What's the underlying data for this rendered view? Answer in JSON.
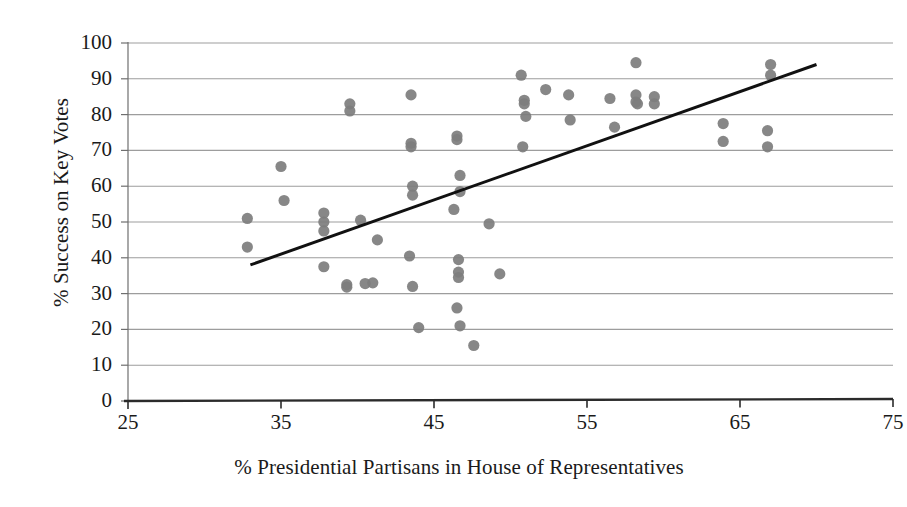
{
  "chart_data": {
    "type": "scatter",
    "title": "",
    "xlabel": "% Presidential Partisans in House of Representatives",
    "ylabel": "% Success on Key Votes",
    "xlim": [
      25,
      75
    ],
    "ylim": [
      0,
      100
    ],
    "xticks": [
      25,
      35,
      45,
      55,
      65,
      75
    ],
    "yticks": [
      0,
      10,
      20,
      30,
      40,
      50,
      60,
      70,
      80,
      90,
      100
    ],
    "grid": "horizontal",
    "legend": "none",
    "marker": {
      "shape": "circle",
      "color": "#7d7d7d",
      "size": 11
    },
    "trendline": {
      "type": "linear",
      "color": "#111111",
      "width": 3,
      "x_start": 33.0,
      "y_start": 38.0,
      "x_end": 70.0,
      "y_end": 94.0
    },
    "points": [
      [
        32.8,
        51.0
      ],
      [
        32.8,
        43.0
      ],
      [
        35.0,
        65.5
      ],
      [
        35.2,
        56.0
      ],
      [
        37.8,
        52.5
      ],
      [
        37.8,
        50.0
      ],
      [
        37.8,
        47.5
      ],
      [
        37.8,
        37.5
      ],
      [
        39.5,
        83.0
      ],
      [
        39.5,
        81.0
      ],
      [
        39.3,
        32.5
      ],
      [
        39.3,
        31.8
      ],
      [
        40.5,
        32.8
      ],
      [
        41.0,
        33.0
      ],
      [
        40.2,
        50.5
      ],
      [
        41.3,
        45.0
      ],
      [
        43.5,
        85.5
      ],
      [
        43.5,
        72.0
      ],
      [
        43.5,
        71.0
      ],
      [
        43.6,
        60.0
      ],
      [
        43.6,
        57.5
      ],
      [
        43.4,
        40.5
      ],
      [
        43.6,
        32.0
      ],
      [
        44.0,
        20.5
      ],
      [
        46.5,
        74.0
      ],
      [
        46.5,
        73.0
      ],
      [
        46.7,
        63.0
      ],
      [
        46.7,
        58.5
      ],
      [
        46.3,
        53.5
      ],
      [
        46.6,
        39.5
      ],
      [
        46.6,
        36.0
      ],
      [
        46.6,
        34.5
      ],
      [
        46.5,
        26.0
      ],
      [
        46.7,
        21.0
      ],
      [
        47.6,
        15.5
      ],
      [
        48.6,
        49.5
      ],
      [
        49.3,
        35.5
      ],
      [
        50.7,
        91.0
      ],
      [
        50.9,
        84.0
      ],
      [
        50.9,
        83.0
      ],
      [
        51.0,
        79.5
      ],
      [
        50.8,
        71.0
      ],
      [
        52.3,
        87.0
      ],
      [
        53.8,
        85.5
      ],
      [
        53.9,
        78.5
      ],
      [
        56.5,
        84.5
      ],
      [
        56.8,
        76.5
      ],
      [
        58.2,
        94.5
      ],
      [
        58.2,
        85.5
      ],
      [
        58.2,
        83.5
      ],
      [
        58.3,
        83.0
      ],
      [
        59.4,
        85.0
      ],
      [
        59.4,
        83.0
      ],
      [
        63.9,
        77.5
      ],
      [
        63.9,
        72.5
      ],
      [
        67.0,
        94.0
      ],
      [
        67.0,
        91.0
      ],
      [
        66.8,
        75.5
      ],
      [
        66.8,
        71.0
      ]
    ]
  },
  "axis": {
    "y_tick_labels": [
      "100",
      "90",
      "80",
      "70",
      "60",
      "50",
      "40",
      "30",
      "20",
      "10",
      "0"
    ],
    "x_tick_labels": [
      "25",
      "35",
      "45",
      "55",
      "65",
      "75"
    ]
  },
  "colors": {
    "marker": "#7d7d7d",
    "trendline": "#111111",
    "gridline": "#8d8d8d",
    "axis": "#1a1a1a",
    "background": "#ffffff"
  }
}
